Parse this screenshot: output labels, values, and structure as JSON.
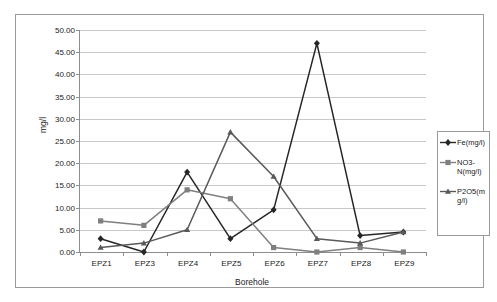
{
  "chart_data": {
    "type": "line",
    "title": "",
    "xlabel": "Borehole",
    "ylabel": "mg/l",
    "categories": [
      "EPZ1",
      "EPZ3",
      "EPZ4",
      "EPZ5",
      "EPZ6",
      "EPZ7",
      "EPZ8",
      "EPZ9"
    ],
    "ylim": [
      0,
      50
    ],
    "ytick_step": 5,
    "ytick_labels": [
      "0.00",
      "5.00",
      "10.00",
      "15.00",
      "20.00",
      "25.00",
      "30.00",
      "35.00",
      "40.00",
      "45.00",
      "50.00"
    ],
    "grid": true,
    "legend_position": "right",
    "series": [
      {
        "name": "Fe(mg/l)",
        "marker": "diamond",
        "color": "#262626",
        "values": [
          3.0,
          0.0,
          18.0,
          3.0,
          9.5,
          47.0,
          3.7,
          4.5
        ]
      },
      {
        "name": "NO3-N(mg/l)",
        "marker": "square",
        "color": "#7f7f7f",
        "values": [
          7.0,
          6.0,
          14.0,
          12.0,
          1.0,
          0.0,
          1.0,
          0.0
        ]
      },
      {
        "name": "P2O5(mg/l)",
        "marker": "triangle",
        "color": "#595959",
        "values": [
          1.0,
          2.0,
          5.0,
          27.0,
          17.0,
          3.0,
          2.0,
          4.5
        ]
      }
    ]
  },
  "legend": {
    "items": [
      {
        "label": "Fe(mg/l)",
        "marker": "diamond-marker-icon"
      },
      {
        "label": "NO3-N(mg/l)",
        "marker": "square-marker-icon"
      },
      {
        "label": "P2O5(mg/l)",
        "marker": "triangle-marker-icon"
      }
    ]
  },
  "axes": {
    "x_title": "Borehole",
    "y_title": "mg/l"
  }
}
